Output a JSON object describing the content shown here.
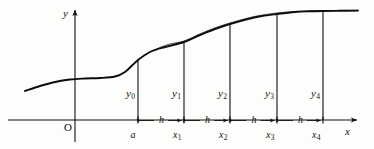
{
  "figure": {
    "axes": {
      "y_label": "y",
      "x_label": "x",
      "origin_label": "O",
      "y_axis_x": 75,
      "x_axis_y": 120,
      "x_axis_end": 357,
      "y_axis_top": 10
    },
    "ordinates": [
      {
        "name": "y0",
        "base": "y",
        "sub": "0",
        "x": 138,
        "top": 60
      },
      {
        "name": "y1",
        "base": "y",
        "sub": "1",
        "x": 184,
        "top": 42
      },
      {
        "name": "y2",
        "base": "y",
        "sub": "2",
        "x": 230,
        "top": 24
      },
      {
        "name": "y3",
        "base": "y",
        "sub": "3",
        "x": 277,
        "top": 14
      },
      {
        "name": "y4",
        "base": "y",
        "sub": "4",
        "x": 323,
        "top": 11
      }
    ],
    "abscissas": [
      {
        "name": "a",
        "base": "a",
        "sub": "",
        "x": 138
      },
      {
        "name": "x1",
        "base": "x",
        "sub": "1",
        "x": 184
      },
      {
        "name": "x2",
        "base": "x",
        "sub": "2",
        "x": 230
      },
      {
        "name": "x3",
        "base": "x",
        "sub": "3",
        "x": 277
      },
      {
        "name": "x4",
        "base": "x",
        "sub": "4",
        "x": 323
      }
    ],
    "steps": [
      {
        "label": "h",
        "from": 138,
        "to": 184
      },
      {
        "label": "h",
        "from": 184,
        "to": 230
      },
      {
        "label": "h",
        "from": 230,
        "to": 277
      },
      {
        "label": "h",
        "from": 277,
        "to": 323
      }
    ],
    "colors": {
      "ink": "#111111",
      "curve": "#0d0d0d",
      "background": "#fdfdfc"
    },
    "curve": {
      "description": "sigmoid-like curve, flat at left near y=78, rising through the interpolation nodes, plateauing at right near y=11",
      "points": [
        [
          25,
          91
        ],
        [
          40,
          86
        ],
        [
          55,
          82
        ],
        [
          70,
          79.5
        ],
        [
          85,
          78.5
        ],
        [
          100,
          78
        ],
        [
          115,
          76.5
        ],
        [
          125,
          72
        ],
        [
          138,
          60
        ],
        [
          150,
          52
        ],
        [
          165,
          47
        ],
        [
          184,
          42
        ],
        [
          200,
          35
        ],
        [
          215,
          29
        ],
        [
          230,
          24
        ],
        [
          248,
          19
        ],
        [
          262,
          16
        ],
        [
          277,
          14
        ],
        [
          295,
          12
        ],
        [
          310,
          11.3
        ],
        [
          323,
          11
        ],
        [
          340,
          10.8
        ],
        [
          358,
          10.6
        ]
      ],
      "secondary_description": "faint second arc slightly above the main curve between the nodes (interpolating polynomial)",
      "secondary_points": [
        [
          138,
          60
        ],
        [
          152,
          51
        ],
        [
          168,
          44.5
        ],
        [
          184,
          41
        ],
        [
          202,
          33
        ],
        [
          216,
          27.5
        ],
        [
          230,
          23
        ],
        [
          250,
          17.5
        ],
        [
          264,
          14.8
        ],
        [
          277,
          13
        ],
        [
          296,
          11.4
        ],
        [
          323,
          10.6
        ],
        [
          358,
          10.3
        ]
      ]
    }
  }
}
